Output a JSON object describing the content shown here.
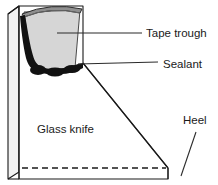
{
  "figure": {
    "background_color": "#ffffff",
    "line_color": "#1a1a1a",
    "trough_fill_color": "#d6d6d6",
    "trough_rim_color": "#9a9a9a",
    "sealant_color": "#111111",
    "body_face_color": "#ffffff",
    "side_face_color": "#f2f2f2"
  },
  "labels": {
    "tape_trough": "Tape trough",
    "sealant": "Sealant",
    "heel": "Heel",
    "glass_knife": "Glass knife"
  },
  "parts": [
    {
      "id": "tape-trough",
      "label": "Tape trough",
      "leader": "horizontal"
    },
    {
      "id": "sealant",
      "label": "Sealant",
      "leader": "diagonal-up-right"
    },
    {
      "id": "heel",
      "label": "Heel",
      "leader": "diagonal-up-right"
    },
    {
      "id": "glass-knife",
      "label": "Glass knife",
      "leader": "none"
    }
  ]
}
